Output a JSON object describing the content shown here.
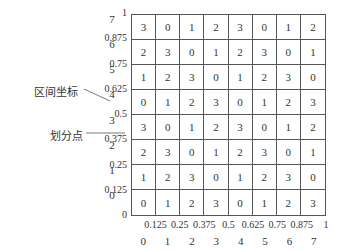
{
  "diagram": {
    "grid": {
      "rows": [
        [
          3,
          0,
          1,
          2,
          3,
          0,
          1,
          2
        ],
        [
          2,
          3,
          0,
          1,
          2,
          3,
          0,
          1
        ],
        [
          1,
          2,
          3,
          0,
          1,
          2,
          3,
          0
        ],
        [
          0,
          1,
          2,
          3,
          0,
          1,
          2,
          3
        ],
        [
          3,
          0,
          1,
          2,
          3,
          0,
          1,
          2
        ],
        [
          2,
          3,
          0,
          1,
          2,
          3,
          0,
          1
        ],
        [
          1,
          2,
          3,
          0,
          1,
          2,
          3,
          0
        ],
        [
          0,
          1,
          2,
          3,
          0,
          1,
          2,
          3
        ]
      ]
    },
    "y_ticks": [
      "1",
      "0.875",
      "0.75",
      "0.625",
      "0.5",
      "0.375",
      "0.25",
      "0.125",
      "0"
    ],
    "y_indices": [
      "7",
      "6",
      "5",
      "4",
      "3",
      "2",
      "1",
      "0"
    ],
    "x_ticks": [
      "0.125",
      "0.25",
      "0.375",
      "0.5",
      "0.625",
      "0.75",
      "0.875",
      "1"
    ],
    "x_indices": [
      "0",
      "1",
      "2",
      "3",
      "4",
      "5",
      "6",
      "7"
    ],
    "annotations": {
      "interval_coordinate": "区间坐标",
      "division_point": "划分点"
    },
    "colors": {
      "line": "#555555",
      "text": "#333333"
    }
  }
}
